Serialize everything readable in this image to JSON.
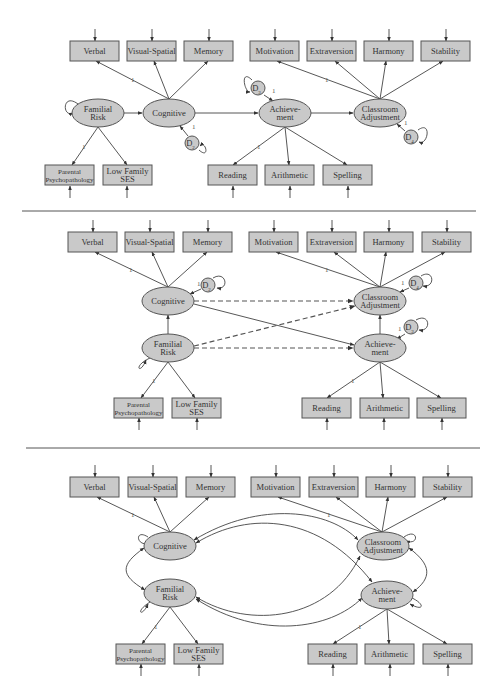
{
  "colors": {
    "node_fill": "#c9c9c9",
    "node_stroke": "#555555",
    "edge": "#444444",
    "background": "#ffffff"
  },
  "labels": {
    "verbal": "Verbal",
    "visual_spatial": "Visual-Spatial",
    "memory": "Memory",
    "motivation": "Motivation",
    "extraversion": "Extraversion",
    "harmony": "Harmony",
    "stability": "Stability",
    "familial_risk": [
      "Familial",
      "Risk"
    ],
    "cognitive": "Cognitive",
    "achievement": [
      "Achieve-",
      "ment"
    ],
    "classroom_adjustment": [
      "Classroom",
      "Adjustment"
    ],
    "parental_psychopathology": [
      "Parental",
      "Psychopathology"
    ],
    "low_family_ses": [
      "Low Family",
      "SES"
    ],
    "reading": "Reading",
    "arithmetic": "Arithmetic",
    "spelling": "Spelling",
    "loading_one": "1"
  },
  "panels": [
    {
      "name": "panel-1-mediation-chain",
      "boxes_top": [
        {
          "key": "verbal",
          "x": 70,
          "y": 41
        },
        {
          "key": "visual_spatial",
          "x": 127,
          "y": 41
        },
        {
          "key": "memory",
          "x": 184,
          "y": 41
        },
        {
          "key": "motivation",
          "x": 250,
          "y": 41
        },
        {
          "key": "extraversion",
          "x": 307,
          "y": 41
        },
        {
          "key": "harmony",
          "x": 364,
          "y": 41
        },
        {
          "key": "stability",
          "x": 421,
          "y": 41
        }
      ],
      "boxes_bottom": [
        {
          "key": "parental_psychopathology",
          "x": 45,
          "y": 165
        },
        {
          "key": "low_family_ses",
          "x": 103,
          "y": 165
        },
        {
          "key": "reading",
          "x": 208,
          "y": 165
        },
        {
          "key": "arithmetic",
          "x": 265,
          "y": 165
        },
        {
          "key": "spelling",
          "x": 323,
          "y": 165
        }
      ],
      "latents": [
        {
          "key": "familial_risk",
          "cx": 98,
          "cy": 113
        },
        {
          "key": "cognitive",
          "cx": 169,
          "cy": 113
        },
        {
          "key": "achievement",
          "cx": 285,
          "cy": 113
        },
        {
          "key": "classroom_adjustment",
          "cx": 380,
          "cy": 113
        }
      ],
      "disturbances": [
        {
          "label": "D",
          "sub": "2",
          "cx": 192,
          "cy": 143
        },
        {
          "label": "D",
          "sub": "3",
          "cx": 258,
          "cy": 88
        },
        {
          "label": "D",
          "sub": "4",
          "cx": 411,
          "cy": 137
        }
      ]
    },
    {
      "name": "panel-2-direct-and-mediated",
      "boxes_top": [
        {
          "key": "verbal",
          "x": 68,
          "y": 232
        },
        {
          "key": "visual_spatial",
          "x": 125,
          "y": 232
        },
        {
          "key": "memory",
          "x": 183,
          "y": 232
        },
        {
          "key": "motivation",
          "x": 249,
          "y": 232
        },
        {
          "key": "extraversion",
          "x": 307,
          "y": 232
        },
        {
          "key": "harmony",
          "x": 364,
          "y": 232
        },
        {
          "key": "stability",
          "x": 422,
          "y": 232
        }
      ],
      "boxes_bottom": [
        {
          "key": "parental_psychopathology",
          "x": 114,
          "y": 398
        },
        {
          "key": "low_family_ses",
          "x": 172,
          "y": 398
        },
        {
          "key": "reading",
          "x": 302,
          "y": 398
        },
        {
          "key": "arithmetic",
          "x": 360,
          "y": 398
        },
        {
          "key": "spelling",
          "x": 417,
          "y": 398
        }
      ],
      "latents": [
        {
          "key": "cognitive",
          "cx": 168,
          "cy": 301
        },
        {
          "key": "classroom_adjustment",
          "cx": 380,
          "cy": 301
        },
        {
          "key": "familial_risk",
          "cx": 168,
          "cy": 348
        },
        {
          "key": "achievement",
          "cx": 380,
          "cy": 348
        }
      ],
      "disturbances": [
        {
          "label": "D",
          "sub": "2",
          "cx": 208,
          "cy": 285
        },
        {
          "label": "D",
          "sub": "4",
          "cx": 416,
          "cy": 283
        },
        {
          "label": "D",
          "sub": "3",
          "cx": 411,
          "cy": 327
        }
      ]
    },
    {
      "name": "panel-3-correlated-factors",
      "boxes_top": [
        {
          "key": "verbal",
          "x": 70,
          "y": 477
        },
        {
          "key": "visual_spatial",
          "x": 128,
          "y": 477
        },
        {
          "key": "memory",
          "x": 186,
          "y": 477
        },
        {
          "key": "motivation",
          "x": 251,
          "y": 477
        },
        {
          "key": "extraversion",
          "x": 309,
          "y": 477
        },
        {
          "key": "harmony",
          "x": 366,
          "y": 477
        },
        {
          "key": "stability",
          "x": 423,
          "y": 477
        }
      ],
      "boxes_bottom": [
        {
          "key": "parental_psychopathology",
          "x": 116,
          "y": 644
        },
        {
          "key": "low_family_ses",
          "x": 174,
          "y": 644
        },
        {
          "key": "reading",
          "x": 308,
          "y": 644
        },
        {
          "key": "arithmetic",
          "x": 365,
          "y": 644
        },
        {
          "key": "spelling",
          "x": 423,
          "y": 644
        }
      ],
      "latents": [
        {
          "key": "cognitive",
          "cx": 170,
          "cy": 546
        },
        {
          "key": "classroom_adjustment",
          "cx": 383,
          "cy": 546
        },
        {
          "key": "familial_risk",
          "cx": 170,
          "cy": 593
        },
        {
          "key": "achievement",
          "cx": 387,
          "cy": 595
        }
      ],
      "disturbances": []
    }
  ],
  "dividers": [
    {
      "y": 211,
      "x1": 22,
      "x2": 476
    },
    {
      "y": 448,
      "x1": 26,
      "x2": 480
    }
  ]
}
